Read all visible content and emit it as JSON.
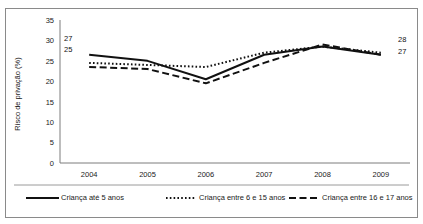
{
  "chart_data": {
    "type": "line",
    "title": "",
    "xlabel": "",
    "ylabel": "Risco de privação (%)",
    "categories": [
      "2004",
      "2005",
      "2006",
      "2007",
      "2008",
      "2009"
    ],
    "ylim": [
      0,
      35
    ],
    "yticks": [
      "0",
      "5",
      "10",
      "15",
      "20",
      "25",
      "30",
      "35"
    ],
    "grid": false,
    "legend_position": "bottom",
    "series": [
      {
        "name": "Criança até 5 anos",
        "style": "solid",
        "color": "#111111",
        "values": [
          26.5,
          25.0,
          20.5,
          26.5,
          28.5,
          26.5
        ]
      },
      {
        "name": "Criança entre 6 e 15 anos",
        "style": "dotted",
        "color": "#111111",
        "values": [
          24.5,
          24.0,
          23.5,
          27.0,
          28.5,
          27.0
        ]
      },
      {
        "name": "Criança entre 16 e 17 anos",
        "style": "dashed",
        "color": "#111111",
        "values": [
          23.5,
          23.0,
          19.5,
          24.5,
          29.0,
          26.5
        ]
      }
    ],
    "annotations": [
      {
        "text": "27",
        "anchor": "left-top",
        "series": "Criança até 5 anos",
        "category": "2004"
      },
      {
        "text": "25",
        "anchor": "left-bottom",
        "series": "Criança entre 6 e 15 anos",
        "category": "2004"
      },
      {
        "text": "28",
        "anchor": "right-top",
        "series": "Criança entre 6 e 15 anos",
        "category": "2009"
      },
      {
        "text": "27",
        "anchor": "right-bottom",
        "series": "Criança até 5 anos",
        "category": "2009"
      }
    ]
  },
  "legend": {
    "items": [
      {
        "label": "Criança até 5 anos",
        "style": "solid"
      },
      {
        "label": "Criança entre 6 e 15 anos",
        "style": "dotted"
      },
      {
        "label": "Criança entre 16 e 17 anos",
        "style": "dashed"
      }
    ]
  }
}
